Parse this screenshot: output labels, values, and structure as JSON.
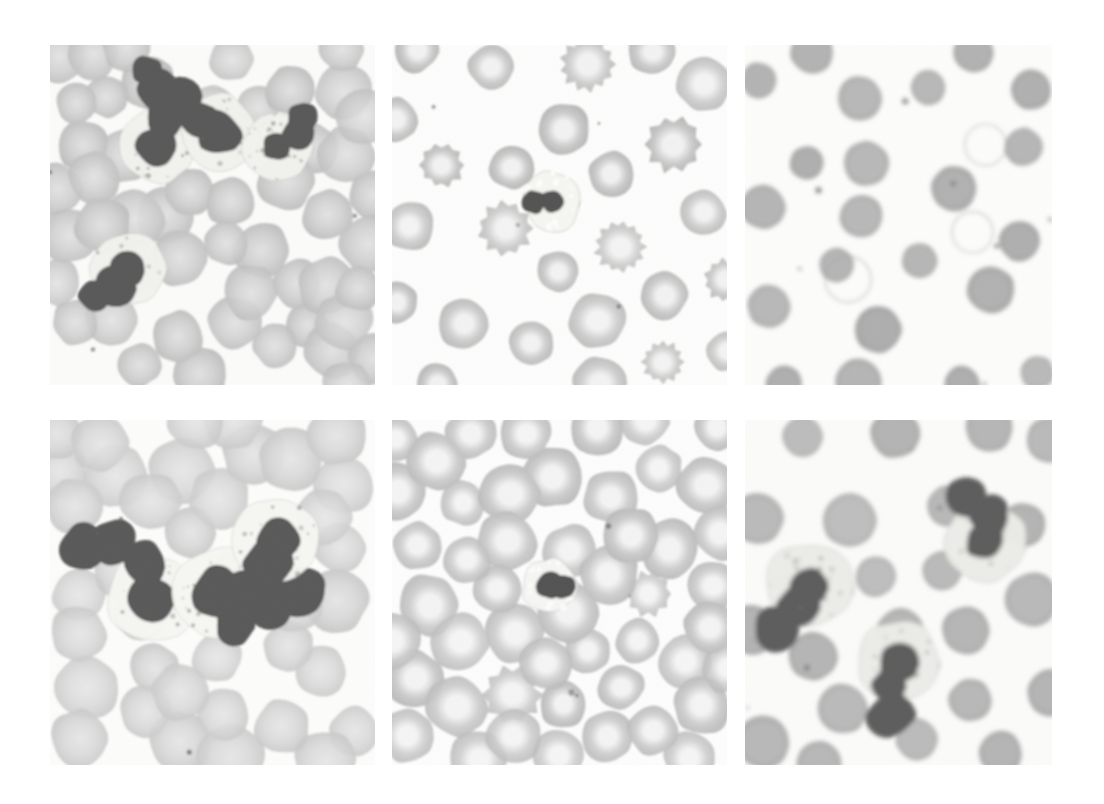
{
  "figure": {
    "background_color": "#ffffff",
    "width": 1104,
    "height": 804,
    "grid": {
      "rows": 2,
      "cols": 3
    },
    "stain": "Wright-Giemsa",
    "panels": [
      {
        "id": "panel-top-left",
        "label": "A",
        "position": {
          "x": 50,
          "y": 45,
          "w": 325,
          "h": 340
        },
        "field_background": "#fbfbfa",
        "rbc_fill": "#c2c2c2",
        "rbc_edge": "#a9a9a9",
        "rbc_pallor": "#d8d8d8",
        "wbc_nucleus": "#151515",
        "wbc_cytoplasm": "#eeeeea",
        "description": "Dense overlapping red cells with four segmented neutrophils",
        "rbc_count": 52,
        "rbc_radius_px": 26,
        "rbc_density": "crowded",
        "wbc_count": 4,
        "wbc_type": "neutrophil",
        "central_pallor": "faint"
      },
      {
        "id": "panel-top-center",
        "label": "B",
        "position": {
          "x": 392,
          "y": 45,
          "w": 335,
          "h": 340
        },
        "field_background": "#fdfdfc",
        "rbc_fill": "#b4b4b4",
        "rbc_edge": "#9a9a9a",
        "rbc_pallor": "#ededed",
        "wbc_nucleus": "#0c0c0c",
        "wbc_cytoplasm": "#f2f2ee",
        "description": "Well separated red cells with distinct central pallor, scattered echinocytes, one small lymphocyte",
        "rbc_count": 46,
        "rbc_radius_px": 25,
        "rbc_density": "separated",
        "wbc_count": 1,
        "wbc_type": "lymphocyte",
        "central_pallor": "prominent",
        "echinocyte_count": 7
      },
      {
        "id": "panel-top-right",
        "label": "C",
        "position": {
          "x": 745,
          "y": 45,
          "w": 307,
          "h": 340
        },
        "field_background": "#fcfcfb",
        "rbc_fill": "#8e8e8e",
        "rbc_edge": "#7c7c7c",
        "rbc_pallor": "#8e8e8e",
        "wbc_nucleus": "#2a2a2a",
        "wbc_cytoplasm": "#e8e8e4",
        "description": "Markedly reduced cell count, small dark spherocytes and ghost cells on pale background",
        "rbc_count": 22,
        "rbc_radius_px": 21,
        "rbc_density": "sparse",
        "wbc_count": 0,
        "wbc_type": "none",
        "central_pallor": "absent",
        "ghost_cell_count": 3
      },
      {
        "id": "panel-bottom-left",
        "label": "D",
        "position": {
          "x": 50,
          "y": 420,
          "w": 325,
          "h": 345
        },
        "field_background": "#fcfcfb",
        "rbc_fill": "#cdcdcd",
        "rbc_edge": "#b6b6b6",
        "rbc_pallor": "#dddddd",
        "wbc_nucleus": "#141414",
        "wbc_cytoplasm": "#f4f4f0",
        "description": "Pale crowded red cells with three granulated neutrophils in the centre",
        "rbc_count": 40,
        "rbc_radius_px": 30,
        "rbc_density": "crowded",
        "wbc_count": 3,
        "wbc_type": "neutrophil",
        "central_pallor": "faint"
      },
      {
        "id": "panel-bottom-center",
        "label": "E",
        "position": {
          "x": 392,
          "y": 420,
          "w": 335,
          "h": 345
        },
        "field_background": "#fdfdfd",
        "rbc_fill": "#b8b8b8",
        "rbc_edge": "#a2a2a2",
        "rbc_pallor": "#f0f0f0",
        "wbc_nucleus": "#0a0a0a",
        "wbc_cytoplasm": "#f3f3ef",
        "description": "Uniform red cells with wide central pallor and a single lymphocyte",
        "rbc_count": 50,
        "rbc_radius_px": 27,
        "rbc_density": "even",
        "wbc_count": 1,
        "wbc_type": "lymphocyte",
        "central_pallor": "prominent",
        "echinocyte_count": 2
      },
      {
        "id": "panel-bottom-right",
        "label": "F",
        "position": {
          "x": 745,
          "y": 420,
          "w": 307,
          "h": 345
        },
        "field_background": "#fbfbfa",
        "rbc_fill": "#969696",
        "rbc_edge": "#858585",
        "rbc_pallor": "#969696",
        "wbc_nucleus": "#1c1c1c",
        "wbc_cytoplasm": "#e6e6e2",
        "description": "Sparse dark spherocytes with three large neutrophils showing coarse granules",
        "rbc_count": 24,
        "rbc_radius_px": 24,
        "rbc_density": "sparse",
        "wbc_count": 3,
        "wbc_type": "neutrophil",
        "central_pallor": "absent"
      }
    ]
  }
}
